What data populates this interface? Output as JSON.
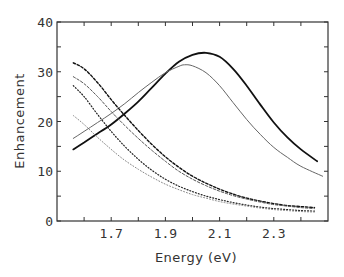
{
  "chart_data": {
    "type": "line",
    "title": "",
    "xlabel": "Energy (eV)",
    "ylabel": "Enhancement",
    "xlim": [
      1.5,
      2.5
    ],
    "ylim": [
      0,
      40
    ],
    "xticks": [
      1.6,
      1.7,
      1.8,
      1.9,
      2.0,
      2.1,
      2.2,
      2.3,
      2.4
    ],
    "xtick_labels": [
      "1.7",
      "1.9",
      "2.1",
      "2.3"
    ],
    "xtick_label_values": [
      1.7,
      1.9,
      2.1,
      2.3
    ],
    "yticks": [
      0,
      5,
      10,
      15,
      20,
      25,
      30,
      35,
      40
    ],
    "ytick_labels": [
      "0",
      "10",
      "20",
      "30",
      "40"
    ],
    "ytick_label_values": [
      0,
      10,
      20,
      30,
      40
    ],
    "grid": false,
    "legend": null,
    "series": [
      {
        "name": "thick-solid",
        "style": "solid",
        "width": 1.8,
        "color": "#111111",
        "x": [
          1.56,
          1.6,
          1.65,
          1.7,
          1.75,
          1.8,
          1.85,
          1.9,
          1.95,
          2.0,
          2.05,
          2.1,
          2.15,
          2.2,
          2.25,
          2.3,
          2.35,
          2.4,
          2.46
        ],
        "y": [
          14.4,
          15.8,
          17.6,
          19.4,
          21.6,
          24.0,
          26.8,
          29.6,
          32.0,
          33.4,
          33.8,
          33.0,
          30.6,
          27.2,
          23.4,
          19.8,
          16.8,
          14.4,
          12.0
        ]
      },
      {
        "name": "thin-solid",
        "style": "solid",
        "width": 1.0,
        "color": "#666666",
        "x": [
          1.56,
          1.6,
          1.65,
          1.7,
          1.75,
          1.8,
          1.85,
          1.9,
          1.95,
          1.97,
          2.0,
          2.05,
          2.1,
          2.15,
          2.2,
          2.25,
          2.3,
          2.35,
          2.4,
          2.48
        ],
        "y": [
          16.6,
          18.0,
          19.8,
          21.6,
          23.6,
          25.8,
          27.9,
          29.8,
          31.1,
          31.4,
          31.2,
          29.8,
          27.2,
          23.8,
          20.4,
          17.4,
          14.8,
          12.8,
          11.0,
          9.0
        ]
      },
      {
        "name": "heavy-dashed",
        "style": "dashed",
        "width": 1.4,
        "color": "#111111",
        "x": [
          1.56,
          1.6,
          1.65,
          1.7,
          1.75,
          1.8,
          1.85,
          1.9,
          1.95,
          2.0,
          2.05,
          2.1,
          2.15,
          2.2,
          2.25,
          2.3,
          2.35,
          2.4,
          2.45
        ],
        "y": [
          31.8,
          30.6,
          27.8,
          24.4,
          21.2,
          18.2,
          15.4,
          12.9,
          10.8,
          9.0,
          7.6,
          6.4,
          5.4,
          4.6,
          4.0,
          3.5,
          3.1,
          2.9,
          2.7
        ]
      },
      {
        "name": "light-dashed",
        "style": "dashed",
        "width": 1.0,
        "color": "#555555",
        "x": [
          1.56,
          1.6,
          1.65,
          1.7,
          1.75,
          1.8,
          1.85,
          1.9,
          1.95,
          2.0,
          2.05,
          2.1,
          2.15,
          2.2,
          2.25,
          2.3,
          2.35,
          2.4,
          2.45
        ],
        "y": [
          29.0,
          27.6,
          25.0,
          22.0,
          19.2,
          16.6,
          14.2,
          12.0,
          10.0,
          8.4,
          7.1,
          6.0,
          5.1,
          4.4,
          3.8,
          3.3,
          3.0,
          2.7,
          2.5
        ]
      },
      {
        "name": "heavy-dotted",
        "style": "dotted",
        "width": 1.2,
        "color": "#222222",
        "x": [
          1.56,
          1.6,
          1.65,
          1.7,
          1.75,
          1.8,
          1.85,
          1.9,
          1.95,
          2.0,
          2.05,
          2.1,
          2.15,
          2.2,
          2.25,
          2.3,
          2.35,
          2.4,
          2.45
        ],
        "y": [
          27.2,
          25.0,
          21.4,
          18.0,
          15.0,
          12.4,
          10.2,
          8.4,
          7.0,
          5.9,
          5.0,
          4.3,
          3.7,
          3.2,
          2.8,
          2.5,
          2.3,
          2.1,
          2.0
        ]
      },
      {
        "name": "light-dotted",
        "style": "dotted",
        "width": 1.0,
        "color": "#888888",
        "x": [
          1.56,
          1.6,
          1.65,
          1.7,
          1.75,
          1.8,
          1.85,
          1.9,
          1.95,
          2.0,
          2.05,
          2.1,
          2.15,
          2.2,
          2.25,
          2.3,
          2.35,
          2.4,
          2.45
        ],
        "y": [
          21.2,
          19.4,
          16.8,
          14.4,
          12.2,
          10.4,
          8.8,
          7.4,
          6.3,
          5.3,
          4.6,
          3.9,
          3.4,
          3.0,
          2.6,
          2.3,
          2.1,
          1.9,
          1.8
        ]
      }
    ]
  }
}
